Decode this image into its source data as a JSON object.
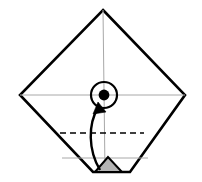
{
  "canvas": {
    "width": 202,
    "height": 182,
    "background": "#ffffff",
    "title": "Origami fold step diagram"
  },
  "colors": {
    "outline": "#000000",
    "crease_guide": "#a8a8a8",
    "fold_dashed": "#000000",
    "shaded_fill": "#b4b4b4",
    "marker_fill": "#000000",
    "arrow": "#000000",
    "paper_fill": "#ffffff"
  },
  "figure": {
    "name": "square-diamond-base",
    "vertices": {
      "top": [
        103,
        10
      ],
      "left": [
        20,
        95
      ],
      "right": [
        185,
        95
      ],
      "bottom_left": [
        93,
        172
      ],
      "bottom_right": [
        130,
        172
      ]
    },
    "outline_path": "M103,10 L185,95 L130,172 L93,172 L20,95 Z",
    "outline_width": 2.6
  },
  "creases": [
    {
      "name": "vertical-center-crease",
      "style": "thin-gray",
      "from": [
        103,
        10
      ],
      "to": [
        105,
        172
      ]
    },
    {
      "name": "horizontal-center-crease",
      "style": "thin-gray",
      "from": [
        20,
        95
      ],
      "to": [
        185,
        95
      ]
    },
    {
      "name": "lower-horizontal-guide",
      "style": "thin-gray",
      "from": [
        62,
        158
      ],
      "to": [
        148,
        158
      ]
    }
  ],
  "fold_lines": [
    {
      "name": "valley-fold-line",
      "type": "valley",
      "style": "dashed",
      "from": [
        60,
        133
      ],
      "to": [
        144,
        133
      ],
      "dash": "6 4",
      "width": 1.7
    }
  ],
  "markers": [
    {
      "name": "center-point-marker",
      "type": "circle-with-dot",
      "center": [
        104,
        95
      ],
      "outer_radius": 13,
      "outer_stroke_width": 2.2,
      "dot_radius": 5.4
    },
    {
      "name": "shaded-triangle-flap",
      "type": "filled-triangle",
      "points": "95,172 108,157 122,172",
      "fill": "#b4b4b4",
      "stroke_width": 2.0
    }
  ],
  "arrows": [
    {
      "name": "fold-up-arrow",
      "type": "curved",
      "path": "M100,170 C88,150 88,124 98,108",
      "width": 2.4,
      "head_points": "98,102 93,114 106,112",
      "direction": "bottom-point-folds-up-to-center"
    }
  ]
}
